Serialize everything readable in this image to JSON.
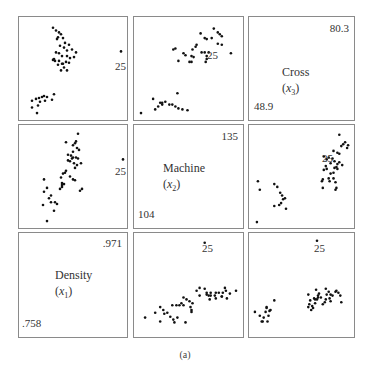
{
  "chart_data": {
    "type": "scatter",
    "title": "",
    "caption": "(a)",
    "layout": "scatterplot-matrix 3x3",
    "variables": [
      {
        "key": "x1",
        "name": "Density",
        "symbol": "x1",
        "min": 0.758,
        "max": 0.971,
        "min_label": ".758",
        "max_label": ".971"
      },
      {
        "key": "x2",
        "name": "Machine",
        "symbol": "x2",
        "min": 104,
        "max": 135,
        "min_label": "104",
        "max_label": "135"
      },
      {
        "key": "x3",
        "name": "Cross",
        "symbol": "x3",
        "min": 48.9,
        "max": 80.3,
        "min_label": "48.9",
        "max_label": "80.3"
      }
    ],
    "highlighted_observation": "25",
    "grid": false,
    "legend": "none",
    "panels": [
      {
        "row": 0,
        "col": 0,
        "x": "x3",
        "y": "x1",
        "note": "y=Density? mirrored; upper-left panel: Density vs Cross"
      },
      {
        "row": 0,
        "col": 1,
        "x": "x2",
        "y": "x3"
      },
      {
        "row": 0,
        "col": 2,
        "diagonal": "x3"
      },
      {
        "row": 1,
        "col": 0,
        "x": "x1",
        "y": "x2"
      },
      {
        "row": 1,
        "col": 1,
        "diagonal": "x2"
      },
      {
        "row": 1,
        "col": 2,
        "x": "x3",
        "y": "x2"
      },
      {
        "row": 2,
        "col": 0,
        "diagonal": "x1"
      },
      {
        "row": 2,
        "col": 1,
        "x": "x2",
        "y": "x1"
      },
      {
        "row": 2,
        "col": 2,
        "x": "x3",
        "y": "x1"
      }
    ]
  },
  "labels": {
    "obs": "25",
    "caption": "(a)",
    "diag": {
      "x3": {
        "name": "Cross",
        "sym": "(x",
        "sub": "3",
        "close": ")",
        "max": "80.3",
        "min": "48.9"
      },
      "x2": {
        "name": "Machine",
        "sym": "(x",
        "sub": "2",
        "close": ")",
        "max": "135",
        "min": "104"
      },
      "x1": {
        "name": "Density",
        "sym": "(x",
        "sub": "1",
        "close": ")",
        "max": ".971",
        "min": ".758"
      }
    }
  },
  "points": {
    "p00": [
      [
        0.3,
        0.07
      ],
      [
        0.33,
        0.1
      ],
      [
        0.36,
        0.12
      ],
      [
        0.38,
        0.14
      ],
      [
        0.35,
        0.17
      ],
      [
        0.34,
        0.19
      ],
      [
        0.4,
        0.18
      ],
      [
        0.42,
        0.23
      ],
      [
        0.37,
        0.26
      ],
      [
        0.41,
        0.28
      ],
      [
        0.46,
        0.25
      ],
      [
        0.44,
        0.31
      ],
      [
        0.49,
        0.3
      ],
      [
        0.33,
        0.33
      ],
      [
        0.36,
        0.34
      ],
      [
        0.39,
        0.37
      ],
      [
        0.44,
        0.37
      ],
      [
        0.47,
        0.39
      ],
      [
        0.51,
        0.38
      ],
      [
        0.53,
        0.33
      ],
      [
        0.3,
        0.41
      ],
      [
        0.32,
        0.42
      ],
      [
        0.35,
        0.46
      ],
      [
        0.39,
        0.45
      ],
      [
        0.43,
        0.43
      ],
      [
        0.46,
        0.44
      ],
      [
        0.41,
        0.49
      ],
      [
        0.38,
        0.52
      ],
      [
        0.44,
        0.52
      ],
      [
        0.4,
        0.45
      ],
      [
        0.36,
        0.42
      ],
      [
        0.31,
        0.4
      ],
      [
        0.09,
        0.84
      ],
      [
        0.13,
        0.82
      ],
      [
        0.16,
        0.81
      ],
      [
        0.19,
        0.8
      ],
      [
        0.21,
        0.79
      ],
      [
        0.24,
        0.8
      ],
      [
        0.29,
        0.83
      ],
      [
        0.31,
        0.77
      ],
      [
        0.15,
        0.89
      ],
      [
        0.09,
        0.91
      ],
      [
        0.14,
        0.97
      ],
      [
        0.17,
        0.85
      ],
      [
        0.22,
        0.84
      ],
      [
        0.98,
        0.32
      ]
    ],
    "p01": [
      [
        0.75,
        0.08
      ],
      [
        0.79,
        0.12
      ],
      [
        0.81,
        0.14
      ],
      [
        0.83,
        0.16
      ],
      [
        0.62,
        0.13
      ],
      [
        0.66,
        0.18
      ],
      [
        0.68,
        0.19
      ],
      [
        0.73,
        0.18
      ],
      [
        0.79,
        0.24
      ],
      [
        0.83,
        0.25
      ],
      [
        0.57,
        0.27
      ],
      [
        0.58,
        0.25
      ],
      [
        0.54,
        0.3
      ],
      [
        0.37,
        0.29
      ],
      [
        0.35,
        0.3
      ],
      [
        0.45,
        0.34
      ],
      [
        0.47,
        0.36
      ],
      [
        0.53,
        0.37
      ],
      [
        0.55,
        0.38
      ],
      [
        0.63,
        0.33
      ],
      [
        0.66,
        0.33
      ],
      [
        0.7,
        0.33
      ],
      [
        0.68,
        0.37
      ],
      [
        0.4,
        0.42
      ],
      [
        0.51,
        0.43
      ],
      [
        0.53,
        0.43
      ],
      [
        0.67,
        0.43
      ],
      [
        0.68,
        0.4
      ],
      [
        0.92,
        0.34
      ],
      [
        0.39,
        0.76
      ],
      [
        0.15,
        0.82
      ],
      [
        0.22,
        0.86
      ],
      [
        0.24,
        0.86
      ],
      [
        0.27,
        0.85
      ],
      [
        0.31,
        0.88
      ],
      [
        0.34,
        0.88
      ],
      [
        0.37,
        0.9
      ],
      [
        0.4,
        0.92
      ],
      [
        0.44,
        0.93
      ],
      [
        0.49,
        0.94
      ],
      [
        0.24,
        0.88
      ],
      [
        0.2,
        0.9
      ],
      [
        0.03,
        0.97
      ],
      [
        0.17,
        0.93
      ]
    ],
    "p10": [
      [
        0.55,
        0.05
      ],
      [
        0.43,
        0.14
      ],
      [
        0.52,
        0.15
      ],
      [
        0.53,
        0.13
      ],
      [
        0.5,
        0.17
      ],
      [
        0.54,
        0.2
      ],
      [
        0.56,
        0.22
      ],
      [
        0.5,
        0.24
      ],
      [
        0.45,
        0.27
      ],
      [
        0.48,
        0.28
      ],
      [
        0.5,
        0.3
      ],
      [
        0.53,
        0.3
      ],
      [
        0.55,
        0.31
      ],
      [
        0.45,
        0.33
      ],
      [
        0.47,
        0.34
      ],
      [
        0.49,
        0.31
      ],
      [
        0.51,
        0.36
      ],
      [
        0.54,
        0.38
      ],
      [
        0.58,
        0.36
      ],
      [
        0.52,
        0.41
      ],
      [
        0.42,
        0.46
      ],
      [
        0.4,
        0.47
      ],
      [
        0.38,
        0.51
      ],
      [
        0.47,
        0.5
      ],
      [
        0.43,
        0.44
      ],
      [
        0.5,
        0.53
      ],
      [
        0.52,
        0.54
      ],
      [
        0.39,
        0.57
      ],
      [
        0.41,
        0.58
      ],
      [
        0.39,
        0.59
      ],
      [
        0.39,
        0.61
      ],
      [
        0.37,
        0.63
      ],
      [
        0.59,
        0.63
      ],
      [
        0.57,
        0.65
      ],
      [
        0.21,
        0.53
      ],
      [
        0.21,
        0.66
      ],
      [
        0.24,
        0.62
      ],
      [
        0.26,
        0.73
      ],
      [
        0.28,
        0.77
      ],
      [
        0.32,
        0.77
      ],
      [
        0.34,
        0.79
      ],
      [
        0.2,
        0.8
      ],
      [
        0.28,
        0.7
      ],
      [
        0.31,
        0.86
      ],
      [
        0.24,
        0.97
      ],
      [
        1.0,
        0.32
      ]
    ],
    "p12": [
      [
        0.89,
        0.06
      ],
      [
        0.95,
        0.14
      ],
      [
        0.93,
        0.16
      ],
      [
        0.97,
        0.2
      ],
      [
        0.98,
        0.17
      ],
      [
        0.91,
        0.18
      ],
      [
        0.83,
        0.23
      ],
      [
        0.87,
        0.25
      ],
      [
        0.89,
        0.26
      ],
      [
        0.73,
        0.29
      ],
      [
        0.76,
        0.32
      ],
      [
        0.78,
        0.3
      ],
      [
        0.82,
        0.31
      ],
      [
        0.8,
        0.36
      ],
      [
        0.84,
        0.34
      ],
      [
        0.87,
        0.37
      ],
      [
        0.89,
        0.35
      ],
      [
        0.92,
        0.38
      ],
      [
        0.73,
        0.43
      ],
      [
        0.76,
        0.42
      ],
      [
        0.75,
        0.39
      ],
      [
        0.86,
        0.4
      ],
      [
        0.87,
        0.42
      ],
      [
        0.84,
        0.41
      ],
      [
        0.8,
        0.47
      ],
      [
        0.83,
        0.46
      ],
      [
        0.72,
        0.53
      ],
      [
        0.71,
        0.55
      ],
      [
        0.78,
        0.52
      ],
      [
        0.79,
        0.55
      ],
      [
        0.83,
        0.52
      ],
      [
        0.85,
        0.56
      ],
      [
        0.72,
        0.62
      ],
      [
        0.85,
        0.64
      ],
      [
        0.86,
        0.62
      ],
      [
        0.22,
        0.58
      ],
      [
        0.25,
        0.61
      ],
      [
        0.28,
        0.67
      ],
      [
        0.3,
        0.7
      ],
      [
        0.31,
        0.74
      ],
      [
        0.33,
        0.73
      ],
      [
        0.29,
        0.78
      ],
      [
        0.27,
        0.8
      ],
      [
        0.34,
        0.84
      ],
      [
        0.22,
        0.81
      ],
      [
        0.05,
        0.55
      ],
      [
        0.07,
        0.64
      ],
      [
        0.04,
        0.98
      ]
    ],
    "p21": [
      [
        0.66,
        0.06
      ],
      [
        0.07,
        0.84
      ],
      [
        0.17,
        0.79
      ],
      [
        0.22,
        0.73
      ],
      [
        0.25,
        0.76
      ],
      [
        0.26,
        0.8
      ],
      [
        0.29,
        0.79
      ],
      [
        0.22,
        0.88
      ],
      [
        0.32,
        0.83
      ],
      [
        0.35,
        0.86
      ],
      [
        0.39,
        0.84
      ],
      [
        0.36,
        0.89
      ],
      [
        0.47,
        0.89
      ],
      [
        0.34,
        0.71
      ],
      [
        0.38,
        0.71
      ],
      [
        0.41,
        0.71
      ],
      [
        0.43,
        0.69
      ],
      [
        0.45,
        0.63
      ],
      [
        0.48,
        0.65
      ],
      [
        0.45,
        0.71
      ],
      [
        0.51,
        0.67
      ],
      [
        0.52,
        0.73
      ],
      [
        0.53,
        0.76
      ],
      [
        0.53,
        0.78
      ],
      [
        0.54,
        0.69
      ],
      [
        0.58,
        0.56
      ],
      [
        0.61,
        0.53
      ],
      [
        0.61,
        0.61
      ],
      [
        0.66,
        0.54
      ],
      [
        0.68,
        0.58
      ],
      [
        0.68,
        0.6
      ],
      [
        0.7,
        0.61
      ],
      [
        0.72,
        0.61
      ],
      [
        0.72,
        0.58
      ],
      [
        0.76,
        0.61
      ],
      [
        0.71,
        0.65
      ],
      [
        0.77,
        0.58
      ],
      [
        0.77,
        0.64
      ],
      [
        0.8,
        0.58
      ],
      [
        0.84,
        0.58
      ],
      [
        0.83,
        0.62
      ],
      [
        0.86,
        0.53
      ],
      [
        0.87,
        0.56
      ],
      [
        0.88,
        0.64
      ],
      [
        0.91,
        0.59
      ],
      [
        0.97,
        0.56
      ],
      [
        0.83,
        0.62
      ]
    ],
    "p22": [
      [
        0.66,
        0.04
      ],
      [
        0.02,
        0.78
      ],
      [
        0.07,
        0.82
      ],
      [
        0.11,
        0.84
      ],
      [
        0.14,
        0.73
      ],
      [
        0.13,
        0.78
      ],
      [
        0.16,
        0.82
      ],
      [
        0.17,
        0.77
      ],
      [
        0.14,
        0.74
      ],
      [
        0.15,
        0.88
      ],
      [
        0.09,
        0.88
      ],
      [
        0.1,
        0.88
      ],
      [
        0.22,
        0.66
      ],
      [
        0.18,
        0.76
      ],
      [
        0.57,
        0.6
      ],
      [
        0.59,
        0.66
      ],
      [
        0.58,
        0.7
      ],
      [
        0.57,
        0.73
      ],
      [
        0.6,
        0.76
      ],
      [
        0.62,
        0.74
      ],
      [
        0.61,
        0.72
      ],
      [
        0.63,
        0.64
      ],
      [
        0.64,
        0.69
      ],
      [
        0.65,
        0.55
      ],
      [
        0.67,
        0.61
      ],
      [
        0.66,
        0.65
      ],
      [
        0.68,
        0.59
      ],
      [
        0.7,
        0.63
      ],
      [
        0.72,
        0.7
      ],
      [
        0.74,
        0.68
      ],
      [
        0.75,
        0.54
      ],
      [
        0.76,
        0.6
      ],
      [
        0.78,
        0.57
      ],
      [
        0.79,
        0.64
      ],
      [
        0.8,
        0.6
      ],
      [
        0.8,
        0.67
      ],
      [
        0.82,
        0.61
      ],
      [
        0.85,
        0.57
      ],
      [
        0.86,
        0.56
      ],
      [
        0.88,
        0.58
      ],
      [
        0.9,
        0.61
      ],
      [
        0.91,
        0.68
      ],
      [
        0.75,
        0.65
      ],
      [
        0.67,
        0.63
      ],
      [
        0.64,
        0.65
      ]
    ]
  }
}
